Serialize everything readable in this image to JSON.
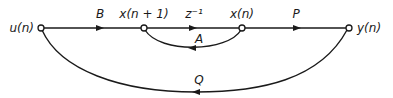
{
  "diagram": {
    "type": "signal-flow-graph",
    "nodes": [
      {
        "id": "u",
        "label": "u(n)",
        "x": 41,
        "y": 28
      },
      {
        "id": "x1",
        "label": "x(n + 1)",
        "x": 144,
        "y": 28
      },
      {
        "id": "x",
        "label": "x(n)",
        "x": 242,
        "y": 28
      },
      {
        "id": "y",
        "label": "y(n)",
        "x": 349,
        "y": 28
      }
    ],
    "edges": [
      {
        "from": "u",
        "to": "x1",
        "gain": "B"
      },
      {
        "from": "x1",
        "to": "x",
        "gain": "z⁻¹"
      },
      {
        "from": "x",
        "to": "y",
        "gain": "P"
      },
      {
        "from": "x",
        "to": "x1",
        "gain": "A"
      },
      {
        "from": "u",
        "to": "y",
        "gain": "Q"
      }
    ]
  }
}
